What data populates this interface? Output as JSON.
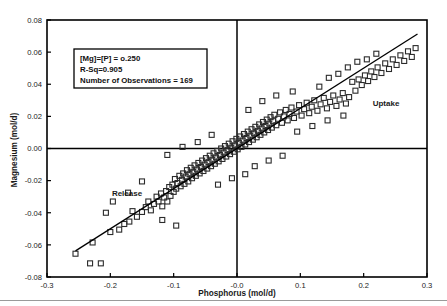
{
  "figure": {
    "background_color": "#ffffff",
    "frame_color": "#000000",
    "marker_color": "#2b2b2b",
    "line_color": "#000000"
  },
  "annotations": {
    "release_label": "Release",
    "uptake_label": "Uptake"
  },
  "stat_box": {
    "line1": "[Mg]=[P] = o.250",
    "line2": "R-Sq=0.905",
    "line3": "Number of Observations = 169"
  },
  "chart_data": {
    "type": "scatter",
    "title": "",
    "xlabel": "Phosphorus (mol/d)",
    "ylabel": "Magnesium (mol/d)",
    "xlim": [
      -0.3,
      0.3
    ],
    "ylim": [
      -0.08,
      0.08
    ],
    "xticks": [
      -0.3,
      -0.2,
      -0.1,
      0.0,
      0.1,
      0.2,
      0.3
    ],
    "xticklabels": [
      "-0.3",
      "-0.2",
      "-0.1",
      "-0.0",
      "0.1",
      "0.2",
      "0.3"
    ],
    "yticks": [
      -0.08,
      -0.06,
      -0.04,
      -0.02,
      0.0,
      0.02,
      0.04,
      0.06,
      0.08
    ],
    "yticklabels": [
      "-0.08",
      "-0.06",
      "-0.04",
      "-0.02",
      "0.00",
      "0.02",
      "0.04",
      "0.06",
      "0.08"
    ],
    "grid": false,
    "legend": false,
    "marker": "open-square",
    "reference_lines": [
      {
        "name": "zero-horizontal",
        "orientation": "horizontal",
        "value": 0.0
      },
      {
        "name": "zero-vertical",
        "orientation": "vertical",
        "value": 0.0
      }
    ],
    "fit_line": {
      "name": "regression-line",
      "slope": 0.25,
      "intercept": 0.0,
      "r_squared": 0.905,
      "x_start": -0.255,
      "x_end": 0.285
    },
    "n_observations": 169,
    "points": [
      [
        -0.255,
        -0.0655
      ],
      [
        -0.232,
        -0.0715
      ],
      [
        -0.215,
        -0.0715
      ],
      [
        -0.228,
        -0.0585
      ],
      [
        -0.2,
        -0.052
      ],
      [
        -0.186,
        -0.0505
      ],
      [
        -0.178,
        -0.047
      ],
      [
        -0.17,
        -0.0455
      ],
      [
        -0.165,
        -0.039
      ],
      [
        -0.158,
        -0.0425
      ],
      [
        -0.15,
        -0.0395
      ],
      [
        -0.144,
        -0.0365
      ],
      [
        -0.14,
        -0.033
      ],
      [
        -0.136,
        -0.0385
      ],
      [
        -0.131,
        -0.0345
      ],
      [
        -0.127,
        -0.03
      ],
      [
        -0.124,
        -0.033
      ],
      [
        -0.12,
        -0.028
      ],
      [
        -0.118,
        -0.036
      ],
      [
        -0.115,
        -0.0305
      ],
      [
        -0.112,
        -0.0265
      ],
      [
        -0.11,
        -0.033
      ],
      [
        -0.107,
        -0.024
      ],
      [
        -0.105,
        -0.0295
      ],
      [
        -0.102,
        -0.0225
      ],
      [
        -0.1,
        -0.027
      ],
      [
        -0.098,
        -0.019
      ],
      [
        -0.096,
        -0.025
      ],
      [
        -0.094,
        -0.0215
      ],
      [
        -0.091,
        -0.017
      ],
      [
        -0.089,
        -0.0235
      ],
      [
        -0.087,
        -0.0195
      ],
      [
        -0.085,
        -0.0155
      ],
      [
        -0.083,
        -0.022
      ],
      [
        -0.081,
        -0.0175
      ],
      [
        -0.079,
        -0.0135
      ],
      [
        -0.077,
        -0.0205
      ],
      [
        -0.075,
        -0.016
      ],
      [
        -0.073,
        -0.012
      ],
      [
        -0.071,
        -0.0185
      ],
      [
        -0.069,
        -0.0145
      ],
      [
        -0.067,
        -0.0105
      ],
      [
        -0.065,
        -0.017
      ],
      [
        -0.063,
        -0.013
      ],
      [
        -0.061,
        -0.009
      ],
      [
        -0.059,
        -0.0155
      ],
      [
        -0.057,
        -0.0115
      ],
      [
        -0.055,
        -0.0075
      ],
      [
        -0.053,
        -0.014
      ],
      [
        -0.051,
        -0.01
      ],
      [
        -0.049,
        -0.006
      ],
      [
        -0.047,
        -0.0125
      ],
      [
        -0.045,
        -0.0085
      ],
      [
        -0.043,
        -0.0045
      ],
      [
        -0.041,
        -0.011
      ],
      [
        -0.039,
        -0.007
      ],
      [
        -0.037,
        -0.003
      ],
      [
        -0.035,
        -0.0095
      ],
      [
        -0.033,
        -0.0055
      ],
      [
        -0.031,
        -0.0015
      ],
      [
        -0.029,
        -0.008
      ],
      [
        -0.027,
        -0.004
      ],
      [
        -0.025,
        0.0
      ],
      [
        -0.023,
        -0.0065
      ],
      [
        -0.021,
        -0.0025
      ],
      [
        -0.019,
        0.0015
      ],
      [
        -0.017,
        -0.005
      ],
      [
        -0.015,
        -0.001
      ],
      [
        -0.013,
        0.003
      ],
      [
        -0.011,
        -0.0035
      ],
      [
        -0.009,
        0.0005
      ],
      [
        -0.007,
        0.0045
      ],
      [
        -0.005,
        -0.002
      ],
      [
        -0.003,
        0.002
      ],
      [
        -0.001,
        0.006
      ],
      [
        0.001,
        -0.0005
      ],
      [
        0.003,
        0.0035
      ],
      [
        0.005,
        0.0075
      ],
      [
        0.007,
        0.001
      ],
      [
        0.009,
        0.005
      ],
      [
        0.011,
        0.009
      ],
      [
        0.013,
        0.0025
      ],
      [
        0.015,
        0.0065
      ],
      [
        0.017,
        0.0105
      ],
      [
        0.019,
        0.004
      ],
      [
        0.021,
        0.008
      ],
      [
        0.023,
        0.012
      ],
      [
        0.025,
        0.0055
      ],
      [
        0.027,
        0.0095
      ],
      [
        0.029,
        0.0135
      ],
      [
        0.031,
        0.007
      ],
      [
        0.033,
        0.011
      ],
      [
        0.035,
        0.015
      ],
      [
        0.037,
        0.0085
      ],
      [
        0.039,
        0.0125
      ],
      [
        0.041,
        0.0165
      ],
      [
        0.043,
        0.01
      ],
      [
        0.045,
        0.014
      ],
      [
        0.047,
        0.018
      ],
      [
        0.049,
        0.0115
      ],
      [
        0.051,
        0.0155
      ],
      [
        0.053,
        0.0195
      ],
      [
        0.055,
        0.013
      ],
      [
        0.057,
        0.017
      ],
      [
        0.059,
        0.021
      ],
      [
        0.062,
        0.0145
      ],
      [
        0.065,
        0.0185
      ],
      [
        0.068,
        0.0225
      ],
      [
        0.071,
        0.016
      ],
      [
        0.074,
        0.02
      ],
      [
        0.077,
        0.024
      ],
      [
        0.08,
        0.0175
      ],
      [
        0.083,
        0.0215
      ],
      [
        0.086,
        0.0255
      ],
      [
        0.09,
        0.019
      ],
      [
        0.094,
        0.023
      ],
      [
        0.098,
        0.027
      ],
      [
        0.102,
        0.0205
      ],
      [
        0.106,
        0.0245
      ],
      [
        0.11,
        0.0285
      ],
      [
        0.114,
        0.022
      ],
      [
        0.118,
        0.026
      ],
      [
        0.122,
        0.03
      ],
      [
        0.127,
        0.0235
      ],
      [
        0.132,
        0.0275
      ],
      [
        0.137,
        0.0315
      ],
      [
        0.142,
        0.025
      ],
      [
        0.147,
        0.029
      ],
      [
        0.152,
        0.033
      ],
      [
        0.157,
        0.0265
      ],
      [
        0.162,
        0.0305
      ],
      [
        0.167,
        0.0345
      ],
      [
        0.172,
        0.028
      ],
      [
        0.177,
        0.032
      ],
      [
        0.182,
        0.0415
      ],
      [
        0.187,
        0.036
      ],
      [
        0.192,
        0.043
      ],
      [
        0.197,
        0.0395
      ],
      [
        0.202,
        0.0455
      ],
      [
        0.207,
        0.042
      ],
      [
        0.212,
        0.048
      ],
      [
        0.217,
        0.0445
      ],
      [
        0.222,
        0.0505
      ],
      [
        0.228,
        0.047
      ],
      [
        0.234,
        0.053
      ],
      [
        0.24,
        0.0495
      ],
      [
        0.246,
        0.0555
      ],
      [
        0.252,
        0.052
      ],
      [
        0.258,
        0.058
      ],
      [
        0.264,
        0.0545
      ],
      [
        0.27,
        0.0605
      ],
      [
        0.276,
        0.057
      ],
      [
        0.282,
        0.0625
      ],
      [
        0.13,
        0.0385
      ],
      [
        0.145,
        0.044
      ],
      [
        0.16,
        0.0465
      ],
      [
        0.175,
        0.0505
      ],
      [
        0.19,
        0.054
      ],
      [
        0.205,
        0.0555
      ],
      [
        0.22,
        0.059
      ],
      [
        0.062,
        0.033
      ],
      [
        0.088,
        0.0355
      ],
      [
        0.04,
        0.0295
      ],
      [
        0.018,
        0.024
      ],
      [
        -0.04,
        0.0085
      ],
      [
        -0.062,
        0.004
      ],
      [
        -0.086,
        0.001
      ],
      [
        -0.11,
        -0.004
      ],
      [
        0.028,
        -0.011
      ],
      [
        0.05,
        -0.0075
      ],
      [
        0.072,
        -0.0045
      ],
      [
        0.013,
        -0.016
      ],
      [
        -0.008,
        -0.0185
      ],
      [
        -0.03,
        -0.0225
      ],
      [
        -0.15,
        -0.0205
      ],
      [
        -0.172,
        -0.0275
      ],
      [
        -0.196,
        -0.033
      ],
      [
        -0.207,
        -0.04
      ],
      [
        -0.118,
        -0.0445
      ],
      [
        -0.096,
        -0.048
      ],
      [
        0.095,
        0.0105
      ],
      [
        0.119,
        0.014
      ],
      [
        0.143,
        0.0175
      ],
      [
        0.168,
        0.0205
      ]
    ]
  }
}
